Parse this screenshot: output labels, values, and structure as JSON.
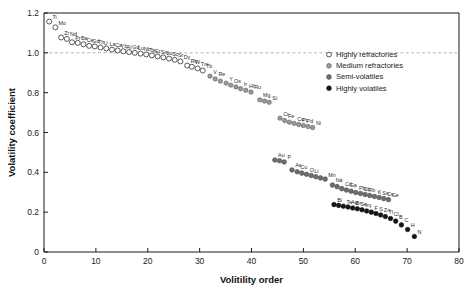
{
  "chart_data": {
    "type": "scatter",
    "title": "",
    "xlabel": "Volitility order",
    "ylabel": "Volatility coefficient",
    "xlim": [
      0,
      80
    ],
    "ylim": [
      0,
      1.2
    ],
    "xticks": [
      0,
      10,
      20,
      30,
      40,
      50,
      60,
      70,
      80
    ],
    "yticks": [
      0,
      0.2,
      0.4,
      0.6,
      0.8,
      1.0,
      1.2
    ],
    "xticklabels": [
      "0",
      "10",
      "20",
      "30",
      "40",
      "50",
      "60",
      "70",
      "80"
    ],
    "yticklabels": [
      "0",
      "0.2",
      "0.4",
      "0.6",
      "0.8",
      "1.0",
      "1.2"
    ],
    "grid": false,
    "reference_line": {
      "y": 1.0,
      "style": "dashed",
      "color": "#b5b5b5"
    },
    "legend_position": "upper-right",
    "series": [
      {
        "name": "Highly refractories",
        "marker": "open-circle",
        "color": "#ffffff",
        "points": [
          {
            "label": "Ti",
            "x": 1.0,
            "y": 1.157
          },
          {
            "label": "Mo",
            "x": 2.2,
            "y": 1.128
          },
          {
            "label": "Zr",
            "x": 3.3,
            "y": 1.077
          },
          {
            "label": "Nd",
            "x": 4.4,
            "y": 1.07
          },
          {
            "label": "Pr",
            "x": 5.4,
            "y": 1.053
          },
          {
            "label": "Ba",
            "x": 6.5,
            "y": 1.05
          },
          {
            "label": "Ce",
            "x": 7.6,
            "y": 1.043
          },
          {
            "label": "Gd",
            "x": 8.7,
            "y": 1.035
          },
          {
            "label": "Th",
            "x": 9.8,
            "y": 1.032
          },
          {
            "label": "U",
            "x": 10.9,
            "y": 1.027
          },
          {
            "label": "La",
            "x": 12.0,
            "y": 1.022
          },
          {
            "label": "Ca",
            "x": 13.1,
            "y": 1.016
          },
          {
            "label": "Yb",
            "x": 14.2,
            "y": 1.012
          },
          {
            "label": "Al",
            "x": 15.3,
            "y": 1.008
          },
          {
            "label": "Gd",
            "x": 16.4,
            "y": 1.004
          },
          {
            "label": "Lu",
            "x": 17.5,
            "y": 1.0
          },
          {
            "label": "Nb",
            "x": 18.6,
            "y": 0.996
          },
          {
            "label": "Ta",
            "x": 19.7,
            "y": 0.992
          },
          {
            "label": "Er",
            "x": 20.8,
            "y": 0.987
          },
          {
            "label": "Sm",
            "x": 21.9,
            "y": 0.982
          },
          {
            "label": "Lu",
            "x": 23.0,
            "y": 0.977
          },
          {
            "label": "Sc",
            "x": 24.1,
            "y": 0.971
          },
          {
            "label": "Sr",
            "x": 25.2,
            "y": 0.965
          },
          {
            "label": "Dy",
            "x": 26.3,
            "y": 0.957
          },
          {
            "label": "Rh",
            "x": 27.6,
            "y": 0.936
          },
          {
            "label": "W",
            "x": 28.5,
            "y": 0.93
          },
          {
            "label": "Tm",
            "x": 29.6,
            "y": 0.922
          },
          {
            "label": "Tb",
            "x": 30.6,
            "y": 0.911
          }
        ]
      },
      {
        "name": "Medium refractories",
        "marker": "filled-gray-circle",
        "color": "#9a9a9a",
        "points": [
          {
            "label": "V",
            "x": 32.0,
            "y": 0.883
          },
          {
            "label": "Re",
            "x": 33.0,
            "y": 0.869
          },
          {
            "label": "",
            "x": 34.0,
            "y": 0.858
          },
          {
            "label": "Y",
            "x": 35.1,
            "y": 0.848
          },
          {
            "label": "Os",
            "x": 36.0,
            "y": 0.838
          },
          {
            "label": "",
            "x": 37.0,
            "y": 0.829
          },
          {
            "label": "Ir",
            "x": 37.9,
            "y": 0.82
          },
          {
            "label": "Hf",
            "x": 38.9,
            "y": 0.812
          },
          {
            "label": "Ru",
            "x": 39.9,
            "y": 0.803
          },
          {
            "label": "Mg",
            "x": 41.6,
            "y": 0.764
          },
          {
            "label": "",
            "x": 42.5,
            "y": 0.758
          },
          {
            "label": "Si",
            "x": 43.4,
            "y": 0.752
          },
          {
            "label": "Cr",
            "x": 45.5,
            "y": 0.672
          },
          {
            "label": "Fe",
            "x": 46.4,
            "y": 0.66
          },
          {
            "label": "",
            "x": 47.3,
            "y": 0.652
          },
          {
            "label": "Co",
            "x": 48.2,
            "y": 0.646
          },
          {
            "label": "Pt",
            "x": 49.1,
            "y": 0.64
          },
          {
            "label": "Pd",
            "x": 50.0,
            "y": 0.635
          },
          {
            "label": "",
            "x": 50.9,
            "y": 0.63
          },
          {
            "label": "Ni",
            "x": 51.8,
            "y": 0.625
          }
        ]
      },
      {
        "name": "Semi-volatiles",
        "marker": "filled-dark-circle",
        "color": "#6e6e6e",
        "points": [
          {
            "label": "Au",
            "x": 44.5,
            "y": 0.462
          },
          {
            "label": "",
            "x": 45.4,
            "y": 0.458
          },
          {
            "label": "P",
            "x": 46.3,
            "y": 0.452
          },
          {
            "label": "As",
            "x": 47.8,
            "y": 0.412
          },
          {
            "label": "Cu",
            "x": 48.8,
            "y": 0.403
          },
          {
            "label": "",
            "x": 49.7,
            "y": 0.396
          },
          {
            "label": "O",
            "x": 50.6,
            "y": 0.39
          },
          {
            "label": "Li",
            "x": 51.5,
            "y": 0.384
          },
          {
            "label": "",
            "x": 52.4,
            "y": 0.378
          },
          {
            "label": "",
            "x": 53.3,
            "y": 0.372
          },
          {
            "label": "Mn",
            "x": 54.2,
            "y": 0.366
          },
          {
            "label": "Na",
            "x": 55.6,
            "y": 0.336
          },
          {
            "label": "",
            "x": 56.5,
            "y": 0.328
          },
          {
            "label": "Cd",
            "x": 57.4,
            "y": 0.318
          },
          {
            "label": "Ga",
            "x": 58.3,
            "y": 0.311
          },
          {
            "label": "",
            "x": 59.2,
            "y": 0.305
          },
          {
            "label": "Pb",
            "x": 60.1,
            "y": 0.299
          },
          {
            "label": "Sb",
            "x": 61.0,
            "y": 0.294
          },
          {
            "label": "Rb",
            "x": 61.9,
            "y": 0.289
          },
          {
            "label": "",
            "x": 62.8,
            "y": 0.284
          },
          {
            "label": "K",
            "x": 63.7,
            "y": 0.279
          },
          {
            "label": "Sn",
            "x": 64.6,
            "y": 0.274
          },
          {
            "label": "Cs",
            "x": 65.5,
            "y": 0.268
          },
          {
            "label": "Ge",
            "x": 66.4,
            "y": 0.263
          }
        ]
      },
      {
        "name": "Highly volatiles",
        "marker": "filled-black-circle",
        "color": "#141414",
        "points": [
          {
            "label": "Bi",
            "x": 55.9,
            "y": 0.238
          },
          {
            "label": "",
            "x": 56.8,
            "y": 0.234
          },
          {
            "label": "Te",
            "x": 57.7,
            "y": 0.23
          },
          {
            "label": "Ag",
            "x": 58.6,
            "y": 0.226
          },
          {
            "label": "Br",
            "x": 59.5,
            "y": 0.221
          },
          {
            "label": "Se",
            "x": 60.4,
            "y": 0.217
          },
          {
            "label": "In",
            "x": 61.3,
            "y": 0.212
          },
          {
            "label": "I",
            "x": 62.2,
            "y": 0.206
          },
          {
            "label": "F",
            "x": 63.1,
            "y": 0.2
          },
          {
            "label": "S",
            "x": 64.0,
            "y": 0.193
          },
          {
            "label": "Zn",
            "x": 64.9,
            "y": 0.186
          },
          {
            "label": "Tl",
            "x": 65.8,
            "y": 0.178
          },
          {
            "label": "Cl",
            "x": 66.8,
            "y": 0.168
          },
          {
            "label": "B",
            "x": 67.8,
            "y": 0.155
          },
          {
            "label": "C",
            "x": 68.9,
            "y": 0.136
          },
          {
            "label": "H",
            "x": 70.1,
            "y": 0.113
          },
          {
            "label": "N",
            "x": 71.4,
            "y": 0.078
          }
        ]
      }
    ]
  },
  "legend": {
    "items": [
      {
        "label": "Highly refractories",
        "marker": "open-circle"
      },
      {
        "label": "Medium refractories",
        "marker": "filled-gray-circle"
      },
      {
        "label": "Semi-volatiles",
        "marker": "filled-dark-circle"
      },
      {
        "label": "Highly volatiles",
        "marker": "filled-black-circle"
      }
    ]
  }
}
